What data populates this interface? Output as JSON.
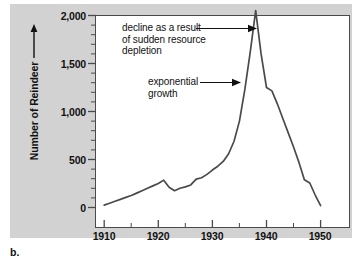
{
  "figure": {
    "letter": "b.",
    "background_color": "#d2d2d2",
    "plot_background_color": "#ffffff",
    "frame_color": "#4a4a4a",
    "line_color": "#4a4a4a"
  },
  "chart_data": {
    "type": "line",
    "title": "",
    "xlabel": "",
    "ylabel": "Number of Reindeer",
    "xlim": [
      1906,
      1952
    ],
    "ylim": [
      0,
      2100
    ],
    "grid": false,
    "legend": "none",
    "x_ticks": [
      1910,
      1920,
      1930,
      1940,
      1950
    ],
    "x_tick_labels": [
      "1910",
      "1920",
      "1930",
      "1940",
      "1950"
    ],
    "x_minor_ticks": [
      1915,
      1925,
      1935,
      1945
    ],
    "y_ticks": [
      0,
      500,
      1000,
      1500,
      2000
    ],
    "y_tick_labels": [
      "0",
      "500",
      "1,000",
      "1,500",
      "2,000"
    ],
    "y_minor_ticks": [
      100,
      200,
      300,
      400,
      600,
      700,
      800,
      900,
      1100,
      1200,
      1300,
      1400,
      1600,
      1700,
      1800,
      1900
    ],
    "series": [
      {
        "name": "Reindeer population",
        "x": [
          1910,
          1911,
          1912,
          1913,
          1914,
          1915,
          1916,
          1917,
          1918,
          1919,
          1920,
          1921,
          1922,
          1923,
          1924,
          1925,
          1926,
          1927,
          1928,
          1929,
          1930,
          1931,
          1932,
          1933,
          1934,
          1935,
          1936,
          1937,
          1938,
          1939,
          1940,
          1941,
          1942,
          1943,
          1944,
          1945,
          1946,
          1947,
          1948,
          1949,
          1950
        ],
        "values": [
          25,
          45,
          65,
          85,
          105,
          125,
          150,
          175,
          200,
          225,
          250,
          285,
          210,
          175,
          200,
          215,
          235,
          295,
          310,
          345,
          390,
          430,
          480,
          560,
          690,
          900,
          1230,
          1620,
          2050,
          1600,
          1250,
          1215,
          1080,
          930,
          780,
          630,
          470,
          290,
          255,
          130,
          20
        ]
      }
    ],
    "annotations": [
      {
        "id": "decline-annotation",
        "text": "decline as a result\nof sudden resource\ndepletion",
        "arrow": true,
        "points_to_year": 1938,
        "points_to_value": 1940
      },
      {
        "id": "exponential-annotation",
        "text": "exponential\ngrowth",
        "arrow": true,
        "points_to_year": 1936,
        "points_to_value": 1400
      }
    ]
  }
}
